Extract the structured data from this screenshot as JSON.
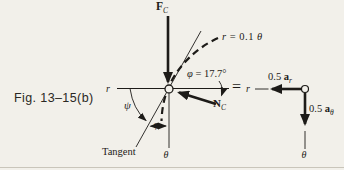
{
  "caption": "Fig. 13–15(b)",
  "equals_sign": "=",
  "colors": {
    "ink": "#1d1b18",
    "paper": "#f2f0ea",
    "rule": "#c9c5ba"
  },
  "fbd": {
    "force": {
      "base": "F",
      "sub": "C"
    },
    "normal": {
      "base": "N",
      "sub": "C"
    },
    "curve_equation": {
      "lhs": "r",
      "rest": " = 0.1 ",
      "theta": "θ"
    },
    "phi_equation": {
      "lhs": "φ",
      "rest": " = 17.7°"
    },
    "psi_label": "ψ",
    "phi_label": "φ",
    "tangent_label": "Tangent",
    "r_axis_label": "r",
    "theta_axis_label": "θ"
  },
  "kinetic": {
    "a_r": {
      "coef": "0.5 ",
      "base": "a",
      "sub": "r"
    },
    "a_theta": {
      "coef": "0.5 ",
      "base": "a",
      "sub": "θ"
    },
    "r_axis_label": "r",
    "theta_axis_label": "θ"
  }
}
